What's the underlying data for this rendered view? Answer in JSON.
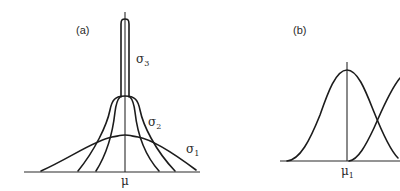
{
  "figure": {
    "panel_a": {
      "label": "(a)",
      "axis_label": "μ",
      "curves": [
        {
          "name": "σ",
          "subscript": "3",
          "description": "narrowest, tallest"
        },
        {
          "name": "σ",
          "subscript": "2",
          "description": "medium width, flat top"
        },
        {
          "name": "σ",
          "subscript": "1",
          "description": "widest, lowest"
        }
      ]
    },
    "panel_b": {
      "label": "(b)",
      "axis_label": "μ",
      "axis_label_subscript": "1",
      "curves": [
        {
          "name": "curve-1",
          "center": "μ1"
        },
        {
          "name": "curve-2",
          "center": "off-screen right"
        }
      ]
    },
    "colors": {
      "line": "#1c1c1c",
      "background": "#ffffff"
    }
  }
}
